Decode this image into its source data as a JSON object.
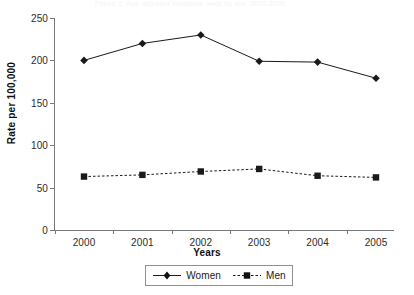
{
  "figure": {
    "top_caption_fragment": "Figure 2. Age-adjusted incidence rates by sex, 2000-2005",
    "background_color": "#ffffff",
    "ink_color": "#1a1a1a",
    "axis_color": "#777b80"
  },
  "chart_data": {
    "type": "line",
    "title": "",
    "xlabel": "Years",
    "ylabel": "Rate per 100,000",
    "categories": [
      "2000",
      "2001",
      "2002",
      "2003",
      "2004",
      "2005"
    ],
    "series": [
      {
        "name": "Women",
        "values": [
          200,
          220,
          230,
          199,
          198,
          179
        ],
        "line_style": "solid",
        "marker": "diamond",
        "color": "#1a1a1a"
      },
      {
        "name": "Men",
        "values": [
          63,
          65,
          69,
          72,
          64,
          62
        ],
        "line_style": "dashed",
        "marker": "square",
        "color": "#1a1a1a"
      }
    ],
    "ylim": [
      0,
      250
    ],
    "yticks": [
      0,
      50,
      100,
      150,
      200,
      250
    ],
    "ytick_labels": [
      "0",
      "50",
      "100",
      "150",
      "200",
      "250"
    ],
    "xtick_labels": [
      "2000",
      "2001",
      "2002",
      "2003",
      "2004",
      "2005"
    ],
    "grid": false,
    "legend_position": "bottom-center",
    "legend_border": true,
    "spines": [
      "left",
      "bottom"
    ]
  },
  "legend": {
    "entries": [
      {
        "label": "Women",
        "marker": "diamond",
        "line_style": "solid"
      },
      {
        "label": "Men",
        "marker": "square",
        "line_style": "dashed"
      }
    ]
  }
}
